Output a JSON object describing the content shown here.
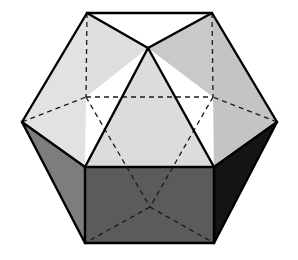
{
  "figure": {
    "name": "cuboctahedron-figure",
    "width": 298,
    "height": 260,
    "background": "#ffffff"
  },
  "style": {
    "face_light": "#e2e2e2",
    "face_light_alt": "#d6d6d6",
    "face_mid": "#b8b8b8",
    "face_gray": "#7d7d7d",
    "face_dark_front": "#5a5a5a",
    "face_dark_right": "#141414",
    "edge_color": "#000000",
    "edge_width": 2.4,
    "hidden_edge_color": "#1a1a1a",
    "hidden_edge_width": 1.3,
    "hidden_edge_dash": "5 4"
  },
  "vertices": {
    "top_left": [
      87,
      13
    ],
    "top_right": [
      212,
      13
    ],
    "apex_front": [
      148,
      48
    ],
    "upper_left_hidden": [
      86,
      97
    ],
    "upper_right_hidden": [
      213,
      97
    ],
    "left": [
      22,
      122
    ],
    "right": [
      277,
      122
    ],
    "mid_left_front": [
      85,
      167
    ],
    "mid_right_front": [
      214,
      167
    ],
    "mid_left_band": [
      112,
      121
    ],
    "mid_right_band": [
      188,
      121
    ],
    "bottom_left": [
      85,
      243
    ],
    "bottom_right": [
      214,
      243
    ],
    "bottom_hidden_center": [
      150,
      207
    ],
    "band_left_upper": [
      56,
      118
    ],
    "band_right_upper": [
      243,
      118
    ]
  },
  "faces": [
    {
      "name": "top-left-triangle",
      "shade": "face_light",
      "points": "87,13 148,48 86,97"
    },
    {
      "name": "top-right-triangle",
      "shade": "face_mid",
      "points": "212,13 148,48 213,97"
    },
    {
      "name": "upper-left-quad",
      "shade": "face_light",
      "points": "87,13 86,97 22,122 22,122"
    },
    {
      "name": "upper-left-large",
      "shade": "face_light",
      "points": "87,13 86,97 85,167 22,122"
    },
    {
      "name": "center-triangle",
      "shade": "face_light_alt",
      "points": "148,48 214,167 85,167"
    },
    {
      "name": "right-upper-quad",
      "shade": "face_mid",
      "points": "212,13 213,97 214,167 277,122"
    },
    {
      "name": "left-gray-face",
      "shade": "face_gray",
      "points": "22,122 85,167 85,243 22,122"
    },
    {
      "name": "left-gray-band",
      "shade": "face_gray",
      "points": "22,122 85,167 85,243 85,243"
    },
    {
      "name": "front-dark-rect",
      "shade": "face_dark_front",
      "points": "85,167 214,167 214,243 85,243"
    },
    {
      "name": "right-dark-face",
      "shade": "face_dark_right",
      "points": "214,167 277,122 277,122 214,243"
    }
  ],
  "solid_edges": [
    {
      "name": "edge-top",
      "from": [
        87,
        13
      ],
      "to": [
        212,
        13
      ]
    },
    {
      "name": "edge-topleft-to-apex",
      "from": [
        87,
        13
      ],
      "to": [
        148,
        48
      ]
    },
    {
      "name": "edge-topright-to-apex",
      "from": [
        212,
        13
      ],
      "to": [
        148,
        48
      ]
    },
    {
      "name": "edge-topleft-to-left",
      "from": [
        87,
        13
      ],
      "to": [
        22,
        122
      ]
    },
    {
      "name": "edge-topright-to-right",
      "from": [
        212,
        13
      ],
      "to": [
        277,
        122
      ]
    },
    {
      "name": "edge-left-to-midleft",
      "from": [
        22,
        122
      ],
      "to": [
        85,
        167
      ]
    },
    {
      "name": "edge-right-to-midright",
      "from": [
        277,
        122
      ],
      "to": [
        214,
        167
      ]
    },
    {
      "name": "edge-apex-to-midleft",
      "from": [
        148,
        48
      ],
      "to": [
        85,
        167
      ]
    },
    {
      "name": "edge-apex-to-midright",
      "from": [
        148,
        48
      ],
      "to": [
        214,
        167
      ]
    },
    {
      "name": "edge-front-top",
      "from": [
        85,
        167
      ],
      "to": [
        214,
        167
      ]
    },
    {
      "name": "edge-front-left",
      "from": [
        85,
        167
      ],
      "to": [
        85,
        243
      ]
    },
    {
      "name": "edge-front-right",
      "from": [
        214,
        167
      ],
      "to": [
        214,
        243
      ]
    },
    {
      "name": "edge-front-bottom",
      "from": [
        85,
        243
      ],
      "to": [
        214,
        243
      ]
    },
    {
      "name": "edge-left-to-bottomleft",
      "from": [
        22,
        122
      ],
      "to": [
        85,
        243
      ]
    },
    {
      "name": "edge-right-to-bottomright",
      "from": [
        277,
        122
      ],
      "to": [
        214,
        243
      ]
    }
  ],
  "hidden_edges": [
    {
      "name": "hidden-topleft-down",
      "from": [
        87,
        13
      ],
      "to": [
        86,
        97
      ]
    },
    {
      "name": "hidden-topright-down",
      "from": [
        212,
        13
      ],
      "to": [
        213,
        97
      ]
    },
    {
      "name": "hidden-band-left",
      "from": [
        22,
        122
      ],
      "to": [
        86,
        97
      ]
    },
    {
      "name": "hidden-band-right",
      "from": [
        277,
        122
      ],
      "to": [
        213,
        97
      ]
    },
    {
      "name": "hidden-band-horizontal",
      "from": [
        86,
        97
      ],
      "to": [
        213,
        97
      ]
    },
    {
      "name": "hidden-upperleft-to-center",
      "from": [
        86,
        97
      ],
      "to": [
        150,
        207
      ]
    },
    {
      "name": "hidden-upperright-to-center",
      "from": [
        213,
        97
      ],
      "to": [
        150,
        207
      ]
    },
    {
      "name": "hidden-center-to-bottomleft",
      "from": [
        150,
        207
      ],
      "to": [
        85,
        243
      ]
    },
    {
      "name": "hidden-center-to-bottomright",
      "from": [
        150,
        207
      ],
      "to": [
        214,
        243
      ]
    }
  ]
}
